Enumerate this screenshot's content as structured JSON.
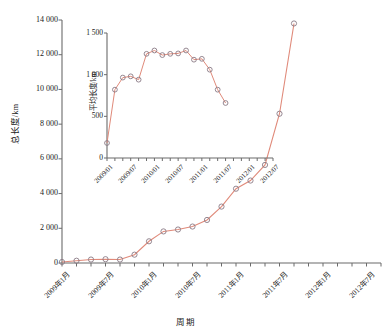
{
  "chart_data": [
    {
      "id": "main",
      "type": "line",
      "title": "",
      "xlabel": "周期",
      "ylabel": "总长度/km",
      "ylim": [
        0,
        14000
      ],
      "yticks": [
        0,
        2000,
        4000,
        6000,
        8000,
        10000,
        12000,
        14000
      ],
      "ytick_labels": [
        "0",
        "2 000",
        "4 000",
        "6 000",
        "8 000",
        "10 000",
        "12 000",
        "14 000"
      ],
      "xtick_labels": [
        "2009年1月",
        "2009年7月",
        "2010年1月",
        "2010年7月",
        "2011年1月",
        "2011年7月",
        "2012年1月",
        "2012年7月"
      ],
      "x_categories": [
        "2009/01",
        "2009/03",
        "2009/05",
        "2009/07",
        "2009/09",
        "2009/11",
        "2010/01",
        "2010/03",
        "2010/05",
        "2010/07",
        "2010/09",
        "2010/11",
        "2011/01",
        "2011/03",
        "2011/05",
        "2011/07",
        "2011/09",
        "2011/11",
        "2012/01",
        "2012/03",
        "2012/05",
        "2012/07",
        "2012/09"
      ],
      "values": [
        60,
        130,
        200,
        220,
        200,
        480,
        1250,
        1820,
        1930,
        2100,
        2480,
        3250,
        4280,
        4750,
        5650,
        8600,
        13800
      ],
      "x_indices": [
        0,
        1,
        2,
        3,
        4,
        5,
        6,
        7,
        8,
        9,
        10,
        11,
        12,
        13,
        14,
        15,
        16
      ],
      "grid": false,
      "legend": "none",
      "series_color": "#e08a7a",
      "marker": "open-circle",
      "marker_edge_color": "#8a7a86"
    },
    {
      "id": "inset",
      "type": "line",
      "title": "",
      "xlabel": "",
      "ylabel": "平均长度/km",
      "ylim": [
        0,
        1500
      ],
      "yticks": [
        0,
        500,
        1000,
        1500
      ],
      "ytick_labels": [
        "0",
        "500",
        "1 000",
        "1 500"
      ],
      "xtick_labels": [
        "2009/01",
        "2009/07",
        "2010/01",
        "2010/07",
        "2011/01",
        "2011/07",
        "2012/01",
        "2012/07"
      ],
      "values": [
        180,
        820,
        965,
        980,
        940,
        1250,
        1290,
        1235,
        1250,
        1255,
        1290,
        1180,
        1190,
        1060,
        820,
        660
      ],
      "x_indices": [
        0,
        1,
        2,
        3,
        4,
        5,
        6,
        7,
        8,
        9,
        10,
        11,
        12,
        13,
        14,
        15
      ],
      "grid": false,
      "legend": "none",
      "series_color": "#e08a7a",
      "marker": "open-circle",
      "marker_edge_color": "#8a7a86"
    }
  ],
  "labels": {
    "main_ylabel": "总长度/km",
    "main_xlabel": "周期",
    "inset_ylabel": "平均长度/km"
  },
  "colors": {
    "line": "#e08a7a",
    "marker_edge": "#8a7a86",
    "axis": "#6b6b6b",
    "text": "#1a1a1a"
  }
}
